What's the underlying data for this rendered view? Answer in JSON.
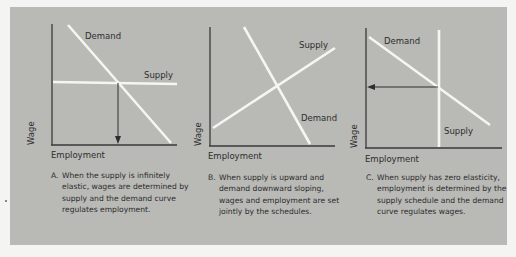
{
  "figure": {
    "axis_labels": {
      "y": "Wage",
      "x": "Employment"
    },
    "colors": {
      "background": "#b9b9b6",
      "page": "#f4f4f2",
      "curve": "#f5f5f2",
      "axis": "#2e2e2e",
      "text": "#2c2c2c"
    },
    "panels": [
      {
        "id": "A",
        "curve_labels": {
          "demand": "Demand",
          "supply": "Supply"
        },
        "supply_shape": "horizontal (infinitely elastic)",
        "demand_shape": "downward sloping",
        "arrow": "from intersection down to employment axis",
        "caption_letter": "A.",
        "caption_text": "When the supply is infinitely elastic, wages are determined by supply and the demand curve regulates employment."
      },
      {
        "id": "B",
        "curve_labels": {
          "demand": "Demand",
          "supply": "Supply"
        },
        "supply_shape": "upward sloping",
        "demand_shape": "downward sloping",
        "arrow": "none",
        "caption_letter": "B.",
        "caption_text": "When supply is upward and demand downward sloping, wages and employment are set jointly by the schedules."
      },
      {
        "id": "C",
        "curve_labels": {
          "demand": "Demand",
          "supply": "Supply"
        },
        "supply_shape": "vertical (zero elasticity)",
        "demand_shape": "downward sloping",
        "arrow": "from intersection left to wage axis",
        "caption_letter": "C.",
        "caption_text": "When supply has zero elasticity, employment is determined by the supply schedule and the demand curve regulates wages."
      }
    ]
  }
}
